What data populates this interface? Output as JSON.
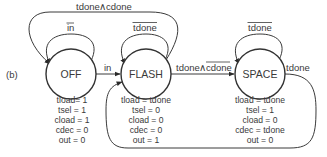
{
  "figure_label": "(b)",
  "states": [
    {
      "id": "OFF",
      "label": "OFF",
      "cx": 71,
      "cy": 74,
      "outputs": [
        "tload= 1",
        "tsel = 1",
        "cload = 1",
        "cdec = 0",
        "out = 0"
      ]
    },
    {
      "id": "FLASH",
      "label": "FLASH",
      "cx": 146,
      "cy": 74,
      "outputs": [
        "tload = tdone",
        "tsel = 0",
        "cload = 0",
        "cdec = 0",
        "out = 1"
      ]
    },
    {
      "id": "SPACE",
      "label": "SPACE",
      "cx": 260,
      "cy": 74,
      "outputs": [
        "tload = tdone",
        "tsel = 1",
        "cload = 0",
        "cdec = tdone",
        "out = 0"
      ]
    }
  ],
  "transitions": [
    {
      "from": "OFF",
      "to": "OFF",
      "label": "in",
      "overline": true
    },
    {
      "from": "OFF",
      "to": "FLASH",
      "label": "in",
      "overline": false
    },
    {
      "from": "FLASH",
      "to": "FLASH",
      "label": "tdone",
      "overline": true
    },
    {
      "from": "FLASH",
      "to": "OFF",
      "label_a": "tdone",
      "op": "∧",
      "label_b": "cdone",
      "overline_b": false
    },
    {
      "from": "FLASH",
      "to": "SPACE",
      "label_a": "tdone",
      "op": "∧",
      "label_b": "cdone",
      "overline_b": true
    },
    {
      "from": "SPACE",
      "to": "SPACE",
      "label": "tdone",
      "overline": true
    },
    {
      "from": "SPACE",
      "to": "FLASH",
      "label": "tdone",
      "overline": false
    }
  ],
  "labels": {
    "off_self": "in",
    "off_to_flash": "in",
    "flash_self": "tdone",
    "flash_to_off_a": "tdone",
    "flash_to_off_op": "∧",
    "flash_to_off_b": "cdone",
    "flash_to_space_a": "tdone",
    "flash_to_space_op": "∧",
    "flash_to_space_b": "cdone",
    "space_self": "tdone",
    "space_to_flash": "tdone"
  }
}
